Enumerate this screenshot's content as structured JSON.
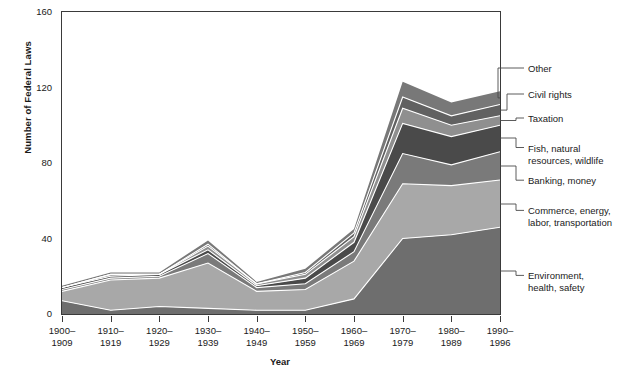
{
  "chart_data": {
    "type": "area",
    "title": "",
    "xlabel": "Year",
    "ylabel": "Number of Federal Laws",
    "ylim": [
      0,
      160
    ],
    "yticks": [
      0,
      40,
      80,
      120,
      160
    ],
    "grid": false,
    "legend_position": "right-outside-leader-lines",
    "stacked": true,
    "categories": [
      "1900-1909",
      "1910-1919",
      "1920-1929",
      "1930-1939",
      "1940-1949",
      "1950-1959",
      "1960-1969",
      "1970-1979",
      "1980-1989",
      "1990-1996"
    ],
    "category_lines": [
      [
        "1900–",
        "1909"
      ],
      [
        "1910–",
        "1919"
      ],
      [
        "1920–",
        "1929"
      ],
      [
        "1930–",
        "1939"
      ],
      [
        "1940–",
        "1949"
      ],
      [
        "1950–",
        "1959"
      ],
      [
        "1960–",
        "1969"
      ],
      [
        "1970–",
        "1979"
      ],
      [
        "1980–",
        "1989"
      ],
      [
        "1990–",
        "1996"
      ]
    ],
    "series": [
      {
        "name": "Environment, health, safety",
        "color": "#6e6e6e",
        "values": [
          7,
          2,
          4,
          3,
          2,
          2,
          8,
          40,
          42,
          46
        ]
      },
      {
        "name": "Commerce, energy, labor, transportation",
        "color": "#a8a8a8",
        "values": [
          5,
          16,
          15,
          24,
          10,
          11,
          20,
          29,
          26,
          25
        ]
      },
      {
        "name": "Banking, money",
        "color": "#7a7a7a",
        "values": [
          1,
          1,
          1,
          5,
          2,
          3,
          5,
          16,
          11,
          15
        ]
      },
      {
        "name": "Fish, natural resources, wildlife",
        "color": "#4a4a4a",
        "values": [
          1,
          1,
          1,
          2,
          1,
          3,
          5,
          16,
          15,
          14
        ]
      },
      {
        "name": "Taxation",
        "color": "#8f8f8f",
        "values": [
          0,
          1,
          0,
          2,
          1,
          2,
          3,
          8,
          6,
          5
        ]
      },
      {
        "name": "Civil rights",
        "color": "#616161",
        "values": [
          0,
          0,
          0,
          1,
          0,
          1,
          2,
          6,
          5,
          6
        ]
      },
      {
        "name": "Other",
        "color": "#787878",
        "values": [
          1,
          1,
          1,
          2,
          1,
          2,
          2,
          8,
          7,
          7
        ]
      }
    ],
    "totals": [
      15,
      22,
      22,
      39,
      17,
      24,
      45,
      123,
      112,
      118
    ],
    "legend_labels": [
      {
        "lines": [
          "Other"
        ]
      },
      {
        "lines": [
          "Civil rights"
        ]
      },
      {
        "lines": [
          "Taxation"
        ]
      },
      {
        "lines": [
          "Fish, natural",
          "resources, wildlife"
        ]
      },
      {
        "lines": [
          "Banking, money"
        ]
      },
      {
        "lines": [
          "Commerce, energy,",
          "labor, transportation"
        ]
      },
      {
        "lines": [
          "Environment,",
          "health, safety"
        ]
      }
    ]
  },
  "colors": {
    "axis": "#3a3a3a",
    "text": "#1a1a1a",
    "separator": "#ffffff",
    "background": "#ffffff"
  }
}
